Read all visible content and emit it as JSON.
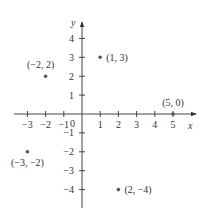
{
  "chart_data": {
    "type": "scatter",
    "title": "",
    "xlabel": "x",
    "ylabel": "y",
    "xlim": [
      -3,
      5
    ],
    "ylim": [
      -4,
      4
    ],
    "grid": false,
    "origin_label": "0",
    "x_ticks": [
      -3,
      -2,
      -1,
      1,
      2,
      3,
      4,
      5
    ],
    "x_tick_labels": [
      "−3",
      "−2",
      "−1",
      "1",
      "2",
      "3",
      "4",
      "5"
    ],
    "y_ticks": [
      4,
      3,
      2,
      1,
      -1,
      -2,
      -3,
      -4
    ],
    "y_tick_labels": [
      "4",
      "3",
      "2",
      "1",
      "−1",
      "−2",
      "−3",
      "−4"
    ],
    "points": [
      {
        "x": 1,
        "y": 3,
        "label": "(1, 3)"
      },
      {
        "x": -2,
        "y": 2,
        "label": "(−2, 2)"
      },
      {
        "x": 5,
        "y": 0,
        "label": "(5, 0)"
      },
      {
        "x": -3,
        "y": -2,
        "label": "(−3, −2)"
      },
      {
        "x": 2,
        "y": -4,
        "label": "(2, −4)"
      }
    ]
  },
  "colors": {
    "axis": "#444444",
    "point": "#555555",
    "text": "#333333"
  }
}
